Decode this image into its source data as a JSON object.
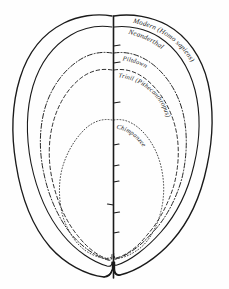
{
  "figure": {
    "background_color": "#fefefe",
    "ink_color": "#1a1a1a",
    "width": 229,
    "height": 289,
    "orientation": "superior (top-down) view, frontal lobes at top, occipital notch at bottom",
    "midline": {
      "name": "sagittal-midline",
      "tick_count": 9,
      "tick_side": "right"
    }
  },
  "curves": [
    {
      "key": "modern",
      "label": "Modern (Homo sapiens)",
      "line_style": "solid",
      "rank": 1,
      "description": "outermost and largest cranial outline"
    },
    {
      "key": "neanderthal",
      "label": "Neanderthal",
      "line_style": "solid",
      "rank": 2,
      "description": "second outline, slightly inside Modern"
    },
    {
      "key": "piltdown",
      "label": "Piltdown",
      "line_style": "dash-dot",
      "rank": 3,
      "description": "third outline, dash-dot stroke"
    },
    {
      "key": "trinil",
      "label": "Trinil (Pithecanthropus)",
      "line_style": "dashed",
      "rank": 4,
      "description": "fourth outline, dashed stroke"
    },
    {
      "key": "chimpanzee",
      "label": "Chimpanzee",
      "line_style": "dotted",
      "rank": 5,
      "description": "innermost and smallest outline, fine dotted stroke"
    }
  ],
  "labels": {
    "modern": "Modern (Homo sapiens)",
    "neanderthal": "Neanderthal",
    "piltdown": "Piltdown",
    "trinil": "Trinil (Pithecanthropus)",
    "chimpanzee": "Chimpanzee"
  }
}
